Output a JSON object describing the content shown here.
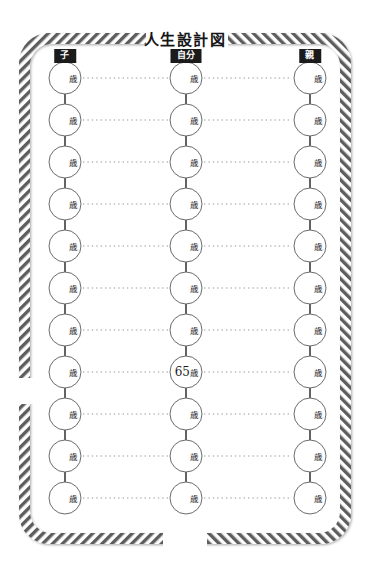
{
  "page": {
    "title": "人生設計図",
    "background_color": "#ffffff",
    "frame_color": "#5d5d5d",
    "accent_color": "#1b1b1b",
    "dotted_line_color": "#9a9a9a",
    "connector_color": "#3c3c3c",
    "circle_stroke_color": "#6b6b6b"
  },
  "columns": [
    {
      "header": "子",
      "name": "child",
      "cx": 65
    },
    {
      "header": "自分",
      "name": "self",
      "cx": 186
    },
    {
      "header": "親",
      "name": "parent",
      "cx": 310
    }
  ],
  "row_count": 11,
  "unit_label": "歳",
  "nodes": {
    "child": [
      "",
      "",
      "",
      "",
      "",
      "",
      "",
      "",
      "",
      "",
      ""
    ],
    "self": [
      "",
      "",
      "",
      "",
      "",
      "",
      "",
      "65",
      "",
      "",
      ""
    ],
    "parent": [
      "",
      "",
      "",
      "",
      "",
      "",
      "",
      "",
      "",
      "",
      ""
    ]
  },
  "geometry": {
    "first_row_cy": 78,
    "row_spacing": 42,
    "circle_radius": 16
  }
}
